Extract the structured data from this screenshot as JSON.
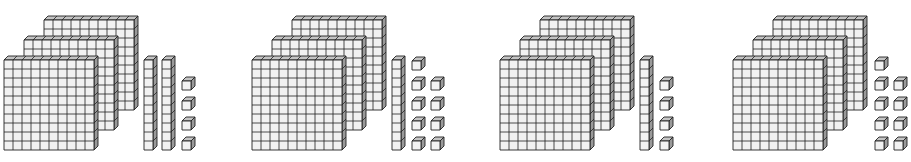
{
  "figure": {
    "type": "base-ten-blocks",
    "colors": {
      "face": "#f2f2f2",
      "side": "#9a9a9a",
      "top": "#c4c4c4",
      "line": "#222222",
      "background": "#ffffff"
    },
    "groups": [
      {
        "label": "Group 1",
        "hundreds": 3,
        "tens": 2,
        "ones": 4,
        "value": "324",
        "x": 4
      },
      {
        "label": "Group 2",
        "hundreds": 3,
        "tens": 1,
        "ones": 9,
        "value": "319",
        "x": 252
      },
      {
        "label": "Group 3",
        "hundreds": 3,
        "tens": 1,
        "ones": 4,
        "value": "314",
        "x": 500
      },
      {
        "label": "Group 4",
        "hundreds": 3,
        "tens": 0,
        "ones": 9,
        "value": "309",
        "x": 733
      }
    ]
  }
}
